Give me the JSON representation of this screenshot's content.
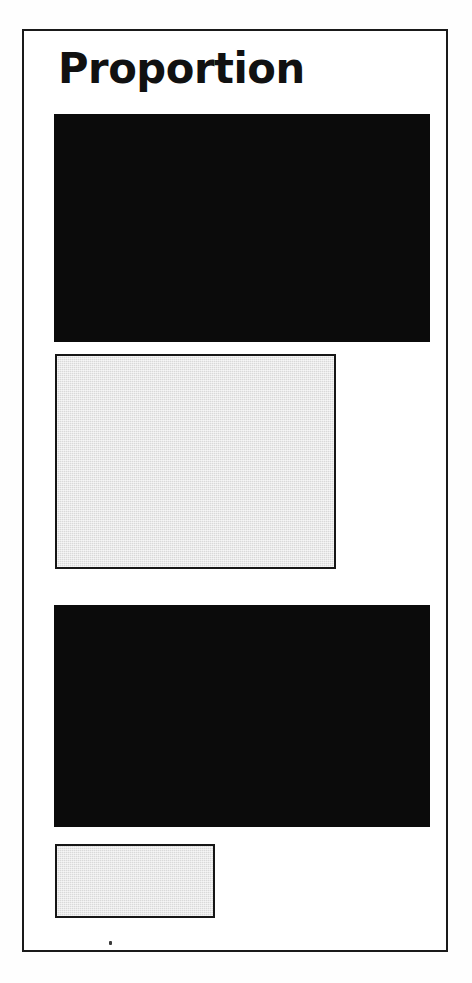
{
  "page": {
    "background_color": "#ffffff",
    "width": 472,
    "height": 983
  },
  "frame": {
    "name": "slide-border",
    "border_color": "#1a1a1a",
    "border_width": 2,
    "fill_color": "#ffffff"
  },
  "slide": {
    "title": "Proportion"
  },
  "artifact": {
    "speck_color": "#3a3a3a"
  },
  "chart_data": {
    "type": "bar",
    "title": "Proportion",
    "subtitle": "",
    "xlabel": "",
    "ylabel": "",
    "orientation": "horizontal",
    "grid": false,
    "legend": false,
    "axis_visible": false,
    "tick_labels": [],
    "categories": [
      "bar-1",
      "bar-2",
      "bar-3",
      "bar-4"
    ],
    "values": [
      376,
      281,
      376,
      160
    ],
    "value_unit": "px width",
    "max_width": 376,
    "proportions": [
      1.0,
      0.747,
      1.0,
      0.426
    ],
    "bars": [
      {
        "index": 1,
        "name": "bar-large-solid-top",
        "style": "solid",
        "fill": "#0b0b0b",
        "stroke": "none",
        "x": 52,
        "y": 112,
        "width": 376,
        "height": 228
      },
      {
        "index": 2,
        "name": "bar-medium-tint-upper",
        "style": "tint",
        "fill": "#d9d9d9",
        "stroke": "#161616",
        "x": 53,
        "y": 352,
        "width": 281,
        "height": 215
      },
      {
        "index": 3,
        "name": "bar-large-solid-bottom",
        "style": "solid",
        "fill": "#0b0b0b",
        "stroke": "none",
        "x": 52,
        "y": 603,
        "width": 376,
        "height": 222
      },
      {
        "index": 4,
        "name": "bar-small-tint-lower",
        "style": "tint",
        "fill": "#d9d9d9",
        "stroke": "#161616",
        "x": 53,
        "y": 842,
        "width": 160,
        "height": 74
      }
    ],
    "colors": {
      "solid": "#0b0b0b",
      "tint_fill": "#d9d9d9",
      "tint_stroke": "#161616"
    }
  }
}
